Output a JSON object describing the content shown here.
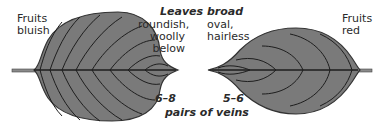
{
  "diagram": {
    "colors": {
      "leaf_fill": "#7a7a7a",
      "vein": "#1e1e1e",
      "outline": "#333333"
    },
    "left_leaf": {
      "fruits_label_line1": "Fruits",
      "fruits_label_line2": "bluish",
      "shape_line1": "roundish,",
      "shape_line2": "woolly",
      "shape_line3": "below",
      "veins_count": "6–8"
    },
    "right_leaf": {
      "fruits_label_line1": "Fruits",
      "fruits_label_line2": "red",
      "shape_line1": "oval,",
      "shape_line2": "hairless",
      "veins_count": "5–6"
    },
    "header": "Leaves broad",
    "footer": "pairs of veins"
  }
}
